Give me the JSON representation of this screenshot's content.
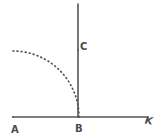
{
  "figure": {
    "background_color": "#ffffff",
    "stroke_color": "#555555",
    "label_color": "#4a4a4a",
    "labels": {
      "a": "A",
      "b": "B",
      "c": "C",
      "k": "K"
    },
    "points": {
      "a": {
        "x": 13,
        "y": 117
      },
      "b": {
        "x": 78,
        "y": 117
      },
      "c": {
        "x": 78,
        "y": 50
      },
      "k": {
        "x": 148,
        "y": 117
      }
    },
    "baseline": {
      "name": "horizontal-baseline",
      "x1": 13,
      "y1": 117,
      "x2": 148,
      "y2": 117,
      "style": "solid",
      "width": 1.6
    },
    "vertical": {
      "name": "vertical-line-bc",
      "x1": 78,
      "y1": 117,
      "x2": 78,
      "y2": 4,
      "style": "solid",
      "width": 1.6
    },
    "arc": {
      "name": "dotted-quarter-arc",
      "center_x": 13,
      "center_y": 117,
      "radius": 66,
      "start_angle_deg": 90,
      "end_angle_deg": 0,
      "style": "dotted",
      "dash_pattern": "0.9 3.2",
      "width": 1.7
    }
  }
}
